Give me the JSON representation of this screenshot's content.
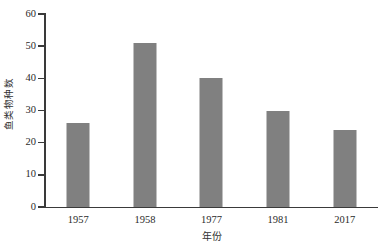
{
  "chart_data": {
    "type": "bar",
    "title": "",
    "subtitle": "",
    "categories": [
      "1957",
      "1958",
      "1977",
      "1981",
      "2017"
    ],
    "values": [
      26,
      51,
      40,
      30,
      24
    ],
    "series": [
      {
        "name": "鱼类物种数",
        "values": [
          26,
          51,
          40,
          30,
          24
        ]
      }
    ],
    "xlabel": "年份",
    "ylabel": "鱼类物种数",
    "ylim": [
      0,
      60
    ],
    "ytick_labels": [
      "0",
      "10",
      "20",
      "30",
      "40",
      "50",
      "60"
    ],
    "ytick_values": [
      0,
      10,
      20,
      30,
      40,
      50,
      60
    ],
    "xtick_labels": [
      "1957",
      "1958",
      "1977",
      "1981",
      "2017"
    ],
    "grid": false,
    "legend": false,
    "legend_position": "none",
    "bar_color": "#808080",
    "axis_color": "#3a3a3a",
    "background_color": "#ffffff",
    "annotations": []
  }
}
